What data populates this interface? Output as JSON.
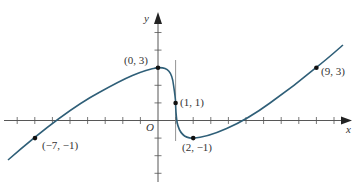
{
  "chart_data": {
    "type": "line",
    "title": "",
    "xlabel": "x",
    "ylabel": "y",
    "origin_label": "O",
    "xlim": [
      -8.5,
      10.5
    ],
    "ylim": [
      -3.5,
      6
    ],
    "grid": false,
    "x_ticks": [
      -8,
      -7,
      -6,
      -5,
      -4,
      -3,
      -2,
      -1,
      1,
      2,
      3,
      4,
      5,
      6,
      7,
      8,
      9,
      10
    ],
    "y_ticks": [
      -3,
      -2,
      -1,
      1,
      2,
      3,
      4,
      5
    ],
    "curve_color": "#2f5f78",
    "labeled_points": [
      {
        "x": -7,
        "y": -1,
        "label": "(−7, −1)"
      },
      {
        "x": 0,
        "y": 3,
        "label": "(0, 3)"
      },
      {
        "x": 1,
        "y": 1,
        "label": "(1, 1)"
      },
      {
        "x": 2,
        "y": -1,
        "label": "(2, −1)"
      },
      {
        "x": 9,
        "y": 3,
        "label": "(9, 3)"
      }
    ],
    "annotations": [
      "vertical tangent line at x = 1"
    ]
  }
}
